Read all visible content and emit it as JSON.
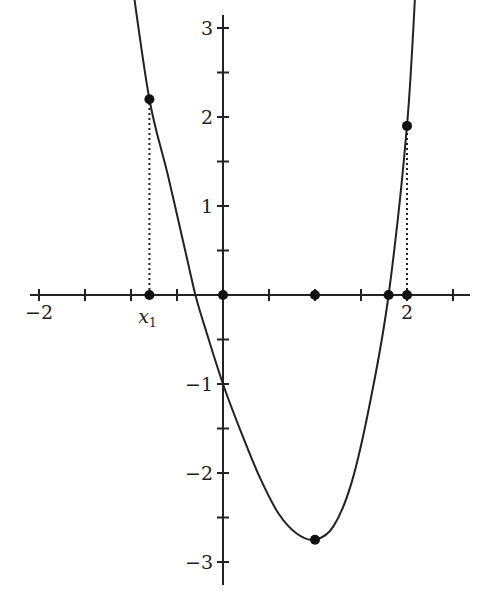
{
  "chart_data": {
    "type": "line",
    "title": "",
    "xlabel": "",
    "ylabel": "",
    "xlim": [
      -2.1,
      2.6
    ],
    "ylim": [
      -3.3,
      3.6
    ],
    "grid": false,
    "x_tick_step": 0.5,
    "y_tick_step": 0.5,
    "x_tick_labels": [
      {
        "value": -2,
        "text": "−2"
      },
      {
        "value": 2,
        "text": "2"
      }
    ],
    "y_tick_labels": [
      {
        "value": 3,
        "text": "3"
      },
      {
        "value": 2,
        "text": "2"
      },
      {
        "value": 1,
        "text": "1"
      },
      {
        "value": -1,
        "text": "−1"
      },
      {
        "value": -2,
        "text": "−2"
      },
      {
        "value": -3,
        "text": "−3"
      }
    ],
    "curve": {
      "description": "smooth curve falling from upper left, crossing y-axis at -1, minimum near (1, -2.75), rising steeply to upper right",
      "points": [
        [
          -1.0,
          3.6
        ],
        [
          -0.8,
          2.2
        ],
        [
          -0.6,
          1.35
        ],
        [
          -0.4,
          0.45
        ],
        [
          -0.3,
          0.0
        ],
        [
          -0.2,
          -0.35
        ],
        [
          0,
          -1.0
        ],
        [
          0.2,
          -1.55
        ],
        [
          0.4,
          -2.05
        ],
        [
          0.6,
          -2.45
        ],
        [
          0.8,
          -2.68
        ],
        [
          1.0,
          -2.75
        ],
        [
          1.2,
          -2.6
        ],
        [
          1.4,
          -2.1
        ],
        [
          1.6,
          -1.2
        ],
        [
          1.8,
          0.0
        ],
        [
          2.0,
          1.9
        ],
        [
          2.1,
          3.6
        ]
      ]
    },
    "marked_points": [
      {
        "x": -0.8,
        "y": 2.2,
        "label": ""
      },
      {
        "x": -0.8,
        "y": 0,
        "label": "x1"
      },
      {
        "x": 0,
        "y": 0,
        "label": ""
      },
      {
        "x": 1.0,
        "y": 0,
        "label": ""
      },
      {
        "x": 1.0,
        "y": -2.75,
        "label": ""
      },
      {
        "x": 1.8,
        "y": 0,
        "label": ""
      },
      {
        "x": 2.0,
        "y": 0,
        "label": ""
      },
      {
        "x": 2.0,
        "y": 1.9,
        "label": ""
      }
    ],
    "dashed_segments": [
      {
        "from": [
          -0.8,
          0
        ],
        "to": [
          -0.8,
          2.2
        ]
      },
      {
        "from": [
          2.0,
          0
        ],
        "to": [
          2.0,
          1.9
        ]
      }
    ],
    "annotations": [
      {
        "text": "x",
        "subscript": "1",
        "at_x": -0.8
      }
    ]
  }
}
